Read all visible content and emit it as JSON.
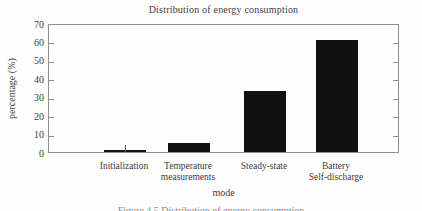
{
  "chart_data": {
    "type": "bar",
    "title": "Distribution of energy consumption",
    "categories": [
      "Initialization",
      "Temperature measurements",
      "Steady-state",
      "Battery Self-discharge"
    ],
    "category_lines": [
      [
        "Initialization"
      ],
      [
        "Temperature",
        "measurements"
      ],
      [
        "Steady-state"
      ],
      [
        "Battery",
        "Self-discharge"
      ]
    ],
    "values": [
      1,
      5,
      33,
      61
    ],
    "xlabel": "mode",
    "ylabel": "percentage (%)",
    "ylim": [
      0,
      70
    ],
    "yticks": [
      0,
      10,
      20,
      30,
      40,
      50,
      60,
      70
    ],
    "grid": false,
    "legend": false,
    "bar_color": "#111111",
    "axis_color": "#8f8f8f",
    "text_color": "#3c3c3c"
  },
  "caption": {
    "text": "Figure 4.5 Distribution of energy consumption"
  }
}
